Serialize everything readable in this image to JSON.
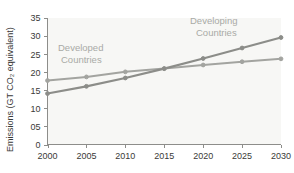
{
  "chart_data": {
    "type": "line",
    "title": "",
    "xlabel": "",
    "ylabel": "Emissions (GT CO₂ equivalent)",
    "x": [
      2000,
      2005,
      2010,
      2015,
      2020,
      2025,
      2030
    ],
    "xtick_labels": [
      "2000",
      "2005",
      "2010",
      "2015",
      "2020",
      "2025",
      "2030"
    ],
    "ytick_labels": [
      "0",
      "05",
      "10",
      "15",
      "20",
      "25",
      "30",
      "35"
    ],
    "ytick_values": [
      0,
      5,
      10,
      15,
      20,
      25,
      30,
      35
    ],
    "xlim": [
      2000,
      2030
    ],
    "ylim": [
      0,
      35
    ],
    "grid": false,
    "legend_position": "inline-annotation",
    "series": [
      {
        "name": "Developed Countries",
        "values": [
          17.7,
          18.7,
          20.1,
          21.0,
          22.0,
          22.9,
          23.7
        ],
        "color": "#a3a4a0",
        "annotation": "Developed\nCountries",
        "annotation_line1": "Developed",
        "annotation_line2": "Countries"
      },
      {
        "name": "Developing Countries",
        "values": [
          14.1,
          16.1,
          18.4,
          21.0,
          23.8,
          26.7,
          29.6
        ],
        "color": "#8c8d89",
        "annotation": "Developing\nCountries",
        "annotation_line1": "Developing",
        "annotation_line2": "Countries"
      }
    ]
  },
  "colors": {
    "plot_background": "#f7f7f5",
    "axis": "#8d8d8a",
    "tick_text": "#3a3a38",
    "annotation_text": "#a9aaa6",
    "developed_series": "#a3a4a0",
    "developing_series": "#8c8d89"
  }
}
